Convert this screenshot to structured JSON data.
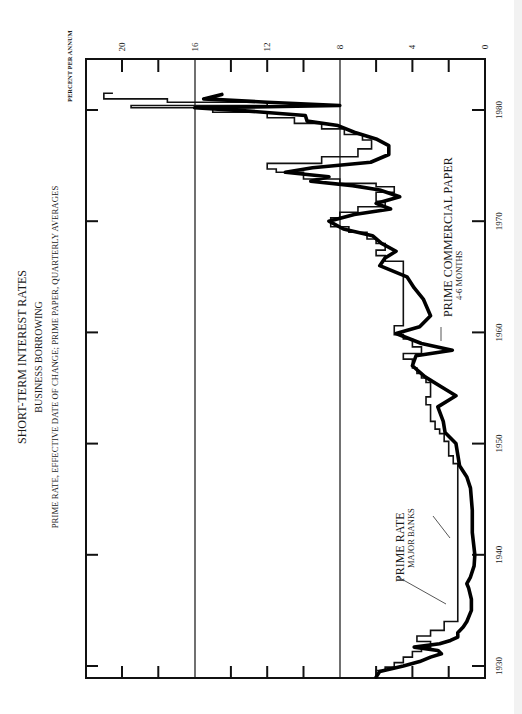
{
  "titles": {
    "title": "SHORT-TERM INTEREST RATES",
    "subtitle": "BUSINESS BORROWING",
    "note": "PRIME RATE, EFFECTIVE DATE OF CHANGE; PRIME PAPER, QUARTERLY AVERAGES",
    "y_unit": "PERCENT PER ANNUM"
  },
  "labels": {
    "prime_rate": "PRIME RATE",
    "prime_rate_sub": "MAJOR BANKS",
    "paper": "PRIME COMMERCIAL PAPER",
    "paper_sub": "4-6 MONTHS"
  },
  "axis": {
    "y_ticks": [
      "0",
      "4",
      "8",
      "12",
      "16",
      "20"
    ],
    "x_ticks": [
      "1930",
      "1940",
      "1950",
      "1960",
      "1970",
      "1980"
    ]
  },
  "chart_data": {
    "type": "line",
    "orientation": "rotated 90 degrees clockwise (time runs bottom-to-top, percent increases right-to-left)",
    "title": "SHORT-TERM INTEREST RATES",
    "subtitle": "BUSINESS BORROWING",
    "note": "PRIME RATE, EFFECTIVE DATE OF CHANGE; PRIME PAPER, QUARTERLY AVERAGES",
    "xlabel": "",
    "ylabel": "PERCENT PER ANNUM",
    "xlim": [
      1929,
      1982
    ],
    "ylim": [
      0,
      22
    ],
    "x_ticks": [
      1930,
      1940,
      1950,
      1960,
      1970,
      1980
    ],
    "y_ticks": [
      0,
      4,
      8,
      12,
      16,
      20
    ],
    "grid_lines_y": [
      8,
      16
    ],
    "series": [
      {
        "name": "PRIME RATE (MAJOR BANKS)",
        "style": "step, thin line",
        "x": [
          1929.0,
          1929.6,
          1929.9,
          1930.3,
          1930.8,
          1931.3,
          1931.7,
          1932.2,
          1932.7,
          1933.2,
          1934.0,
          1947.8,
          1948.2,
          1948.9,
          1950.2,
          1950.9,
          1951.3,
          1952.0,
          1953.5,
          1954.2,
          1955.5,
          1955.9,
          1956.3,
          1956.8,
          1957.6,
          1958.1,
          1958.7,
          1959.4,
          1959.8,
          1960.6,
          1965.9,
          1966.4,
          1966.9,
          1967.4,
          1968.0,
          1968.4,
          1969.0,
          1969.5,
          1970.3,
          1970.8,
          1971.3,
          1971.8,
          1972.6,
          1973.1,
          1973.4,
          1973.8,
          1974.4,
          1974.7,
          1975.2,
          1975.8,
          1976.5,
          1977.3,
          1977.8,
          1978.3,
          1978.8,
          1979.3,
          1979.8,
          1980.2,
          1980.4,
          1980.7,
          1981.0,
          1981.5
        ],
        "y": [
          6.0,
          5.5,
          5.0,
          4.5,
          4.0,
          3.5,
          3.0,
          3.75,
          3.0,
          2.25,
          1.5,
          1.5,
          1.75,
          2.0,
          2.25,
          2.5,
          2.75,
          3.0,
          3.25,
          3.0,
          3.25,
          3.5,
          3.75,
          4.0,
          4.5,
          3.5,
          4.0,
          4.5,
          5.0,
          4.5,
          4.5,
          5.5,
          6.0,
          5.5,
          6.0,
          6.5,
          7.5,
          8.5,
          8.0,
          7.0,
          5.5,
          6.0,
          5.0,
          6.0,
          8.0,
          10.0,
          11.5,
          12.0,
          9.0,
          7.0,
          6.25,
          6.75,
          7.75,
          9.0,
          10.5,
          12.0,
          15.0,
          19.5,
          12.0,
          17.5,
          21.0,
          20.5
        ]
      },
      {
        "name": "PRIME COMMERCIAL PAPER (4-6 MONTHS)",
        "style": "quarterly averages, bold line",
        "x": [
          1929.0,
          1929.5,
          1930.0,
          1930.4,
          1930.8,
          1931.1,
          1931.4,
          1931.7,
          1932.0,
          1932.3,
          1932.6,
          1933.0,
          1933.5,
          1934.0,
          1935.0,
          1936.0,
          1937.0,
          1937.4,
          1938.0,
          1939.0,
          1940.0,
          1942.0,
          1944.0,
          1946.0,
          1947.0,
          1948.0,
          1949.0,
          1950.0,
          1951.0,
          1952.0,
          1953.3,
          1954.3,
          1955.0,
          1956.0,
          1957.0,
          1957.9,
          1958.4,
          1959.0,
          1959.9,
          1960.5,
          1961.5,
          1963.0,
          1964.0,
          1965.0,
          1966.0,
          1966.7,
          1967.3,
          1968.0,
          1968.7,
          1969.3,
          1970.0,
          1970.6,
          1971.1,
          1971.6,
          1972.2,
          1972.8,
          1973.2,
          1973.6,
          1974.0,
          1974.4,
          1974.8,
          1975.3,
          1976.0,
          1976.8,
          1977.4,
          1978.0,
          1978.6,
          1979.0,
          1979.5,
          1979.9,
          1980.2,
          1980.4,
          1980.7,
          1981.0,
          1981.4
        ],
        "y": [
          6.0,
          5.8,
          4.5,
          3.6,
          3.0,
          2.4,
          2.6,
          3.9,
          2.5,
          1.9,
          1.5,
          1.5,
          1.2,
          1.0,
          0.75,
          0.75,
          0.9,
          1.0,
          0.8,
          0.6,
          0.56,
          0.7,
          0.7,
          0.8,
          1.0,
          1.4,
          1.5,
          1.6,
          2.2,
          2.3,
          2.6,
          1.6,
          2.3,
          3.3,
          4.0,
          3.8,
          1.8,
          3.5,
          4.9,
          3.6,
          3.0,
          3.4,
          3.9,
          4.3,
          5.8,
          5.5,
          4.9,
          5.7,
          6.2,
          7.8,
          8.6,
          7.2,
          5.2,
          6.0,
          4.7,
          5.8,
          7.3,
          9.6,
          8.6,
          11.0,
          9.5,
          6.3,
          5.3,
          5.3,
          6.0,
          7.2,
          8.1,
          9.8,
          9.9,
          13.0,
          16.0,
          8.0,
          12.0,
          15.5,
          14.5
        ]
      }
    ],
    "annotations": [
      "PRIME RATE / MAJOR BANKS",
      "PRIME COMMERCIAL PAPER / 4-6 MONTHS"
    ]
  }
}
